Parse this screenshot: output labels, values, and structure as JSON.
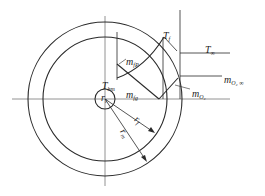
{
  "diagram": {
    "type": "droplet combustion profile",
    "stroke_color": "#2a2a2a",
    "axis_color": "#777777",
    "geometry": {
      "center": [
        105,
        99
      ],
      "droplet_radius": 10,
      "flame_radius": 62,
      "outer_radius": 77
    },
    "labels": {
      "t_f": {
        "main": "T",
        "sub": "f"
      },
      "t_inf": {
        "main": "T",
        "sub": "∞"
      },
      "m_fp": {
        "main": "m",
        "sub": "fP"
      },
      "t_bm": {
        "main": "T",
        "sub": "bm"
      },
      "m_fg": {
        "main": "m",
        "sub": "fg"
      },
      "r_l": {
        "main": "r",
        "sub": "l"
      },
      "m_o2_inf": {
        "main": "m",
        "sub": "O₂ ∞"
      },
      "m_o2": {
        "main": "m",
        "sub": "O₂"
      },
      "r_f": {
        "main": "r",
        "sub": "f"
      },
      "r_m": {
        "main": "r",
        "sub": "m"
      }
    }
  }
}
